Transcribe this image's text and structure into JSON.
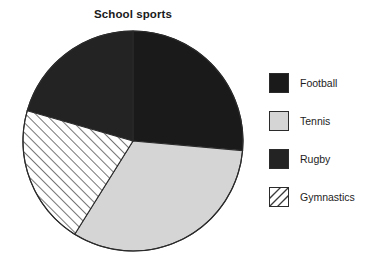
{
  "chart_data": {
    "type": "pie",
    "title": "School sports",
    "xlabel": "",
    "ylabel": "",
    "legend_position": "right",
    "grid": false,
    "categories": [
      "Football",
      "Tennis",
      "Rugby",
      "Gymnastics"
    ],
    "values": [
      26,
      32,
      21,
      21
    ],
    "units": "percent",
    "slices": [
      {
        "label": "Football",
        "value": 26,
        "start_angle": 0,
        "end_angle": 95,
        "fill": "#1a1a1a",
        "pattern": "solid",
        "swatch_name": "legend-swatch-football"
      },
      {
        "label": "Tennis",
        "value": 32,
        "start_angle": 95,
        "end_angle": 212,
        "fill": "#d5d5d5",
        "pattern": "solid",
        "swatch_name": "legend-swatch-tennis"
      },
      {
        "label": "Rugby",
        "value": 21,
        "start_angle": 286,
        "end_angle": 360,
        "fill": "#232323",
        "pattern": "solid",
        "swatch_name": "legend-swatch-rugby"
      },
      {
        "label": "Gymnastics",
        "value": 21,
        "start_angle": 212,
        "end_angle": 286,
        "fill": "#ffffff",
        "pattern": "diagonal-hatch",
        "swatch_name": "legend-swatch-gymnastics"
      }
    ],
    "geometry": {
      "center_x": 133,
      "center_y": 141,
      "radius": 110
    },
    "colors": {
      "football": "#1a1a1a",
      "tennis": "#d5d5d5",
      "rugby": "#232323",
      "gymnastics_hatch": "#3a3a3a",
      "outline": "#2b2b2b",
      "background": "#ffffff",
      "text": "#1d1d1d"
    }
  },
  "legend": {
    "items": [
      {
        "label": "Football"
      },
      {
        "label": "Tennis"
      },
      {
        "label": "Rugby"
      },
      {
        "label": "Gymnastics"
      }
    ]
  }
}
